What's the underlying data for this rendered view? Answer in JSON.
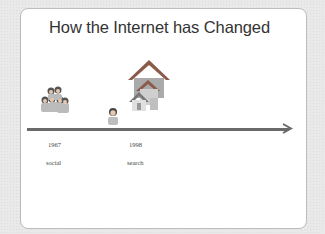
{
  "slide": {
    "title": "How the Internet has Changed"
  },
  "timeline": {
    "events": [
      {
        "year": "1967",
        "label": "social",
        "icon": "people-group-icon"
      },
      {
        "year": "1998",
        "label": "search",
        "icon": "person-icon"
      }
    ],
    "extra_icon": "houses-icon"
  }
}
